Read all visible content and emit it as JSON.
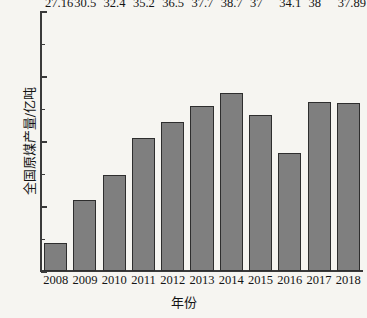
{
  "chart_data": {
    "type": "bar",
    "title": "",
    "xlabel": "年份",
    "ylabel": "全国原煤产量/亿吨",
    "categories": [
      "2008",
      "2009",
      "2010",
      "2011",
      "2012",
      "2013",
      "2014",
      "2015",
      "2016",
      "2017",
      "2018"
    ],
    "values": [
      27.16,
      30.5,
      32.4,
      35.2,
      36.5,
      37.7,
      38.7,
      37,
      34.1,
      38,
      37.89
    ],
    "value_labels": [
      "27.16",
      "30.5",
      "32.4",
      "35.2",
      "36.5",
      "37.7",
      "38.7",
      "37",
      "34.1",
      "38",
      "37.89"
    ],
    "ylim": [
      25,
      45
    ],
    "xlim_note": "categorical",
    "y_major_ticks": [
      25,
      30,
      35,
      40,
      45
    ],
    "y_major_tick_labels": [
      "25",
      "30",
      "35",
      "40",
      "45"
    ],
    "y_minor_ticks": [
      27.5,
      32.5,
      37.5,
      42.5
    ],
    "grid": false,
    "legend": null,
    "legend_position": "none",
    "series": [
      {
        "name": "全国原煤产量",
        "values": [
          27.16,
          30.5,
          32.4,
          35.2,
          36.5,
          37.7,
          38.7,
          37,
          34.1,
          38,
          37.89
        ]
      }
    ]
  },
  "style": {
    "bar_fill": "#7f7f7f",
    "bar_border": "#2e2e2e",
    "axis_color": "#3a3a3a",
    "background": "#f6f5f1",
    "text_color": "#141414"
  }
}
